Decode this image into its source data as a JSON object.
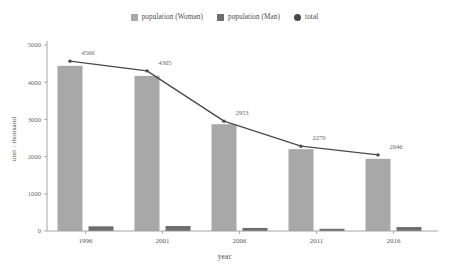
{
  "chart_data": {
    "type": "bar",
    "title": "",
    "subtitle": "",
    "xlabel": "year",
    "ylabel": "unit : thousand",
    "categories": [
      "1996",
      "2001",
      "2006",
      "2011",
      "2016"
    ],
    "ylim": [
      0,
      5000
    ],
    "yticks": [
      0,
      1000,
      2000,
      3000,
      4000,
      5000
    ],
    "ytick_labels": [
      "0",
      "1000",
      "2000",
      "3000",
      "4000",
      "5000"
    ],
    "grid": false,
    "legend_position": "top-center",
    "series": [
      {
        "name": "population (Woman)",
        "type": "bar",
        "color": "#a8a8a8",
        "values": [
          4440,
          4170,
          2870,
          2200,
          1940
        ]
      },
      {
        "name": "population (Man)",
        "type": "bar",
        "color": "#6e6e6e",
        "values": [
          126,
          135,
          83,
          55,
          106
        ]
      },
      {
        "name": "total",
        "type": "line",
        "color": "#4a4a4a",
        "values": [
          4566,
          4305,
          2953,
          2279,
          2046
        ],
        "point_labels": [
          "4566",
          "4305",
          "2953",
          "2279",
          "2046"
        ]
      }
    ]
  },
  "legend": {
    "items": [
      {
        "label": "population (Woman)",
        "marker": "square",
        "color": "#a8a8a8"
      },
      {
        "label": "population (Man)",
        "marker": "square",
        "color": "#6e6e6e"
      },
      {
        "label": "total",
        "marker": "circle",
        "color": "#4a4a4a"
      }
    ]
  },
  "axes": {
    "y_title": "unit : thousand",
    "x_title": "year",
    "axis_color": "#9a9a9a"
  }
}
